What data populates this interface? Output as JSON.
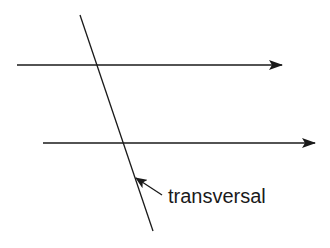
{
  "diagram": {
    "labels": {
      "transversal": "transversal"
    },
    "stroke_color": "#1a1a1a",
    "background": "#ffffff",
    "lines": [
      {
        "name": "parallel-line-top",
        "x1": 17,
        "y1": 65,
        "x2": 282,
        "y2": 65,
        "arrow": "end"
      },
      {
        "name": "parallel-line-bottom",
        "x1": 43,
        "y1": 143,
        "x2": 315,
        "y2": 143,
        "arrow": "end"
      },
      {
        "name": "transversal-line",
        "x1": 80,
        "y1": 15,
        "x2": 153,
        "y2": 231
      }
    ]
  }
}
